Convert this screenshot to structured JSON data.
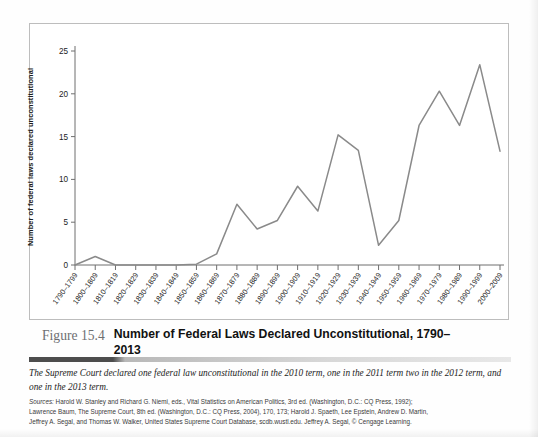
{
  "figure": {
    "number": "Figure 15.4",
    "title": "Number of Federal Laws Declared Unconstitutional, 1790–2013",
    "note": "The Supreme Court declared one federal law unconstitutional in the 2010 term, one in the 2011 term two in the 2012 term, and one in the 2013 term.",
    "sources_label": "Sources:",
    "sources_line1": " Harold W. Stanley and Richard G. Niemi, eds., Vital Statistics on American Politics, 3rd ed. (Washington, D.C.: CQ Press, 1992);",
    "sources_line2": "Lawrence Baum, The Supreme Court, 8th ed. (Washington, D.C.: CQ Press, 2004), 170, 173; Harold J. Spaeth, Lee Epstein, Andrew D. Martin,",
    "sources_line3": "Jeffrey A. Segal, and Thomas W. Walker, United States Supreme Court Database, scdb.wustl.edu. Jeffrey A. Segal, © Cengage Learning."
  },
  "chart_data": {
    "type": "line",
    "title": "Number of Federal Laws Declared Unconstitutional, 1790–2013",
    "xlabel": "",
    "ylabel": "Number of federal laws declared unconstitutional",
    "ylim": [
      0,
      25
    ],
    "yticks": [
      0,
      5,
      10,
      15,
      20,
      25
    ],
    "grid": false,
    "legend": "none",
    "line_color": "#8a8a8a",
    "categories": [
      "1790–1799",
      "1800–1809",
      "1810–1819",
      "1820–1829",
      "1830–1839",
      "1840–1849",
      "1850–1859",
      "1860–1869",
      "1870–1879",
      "1880–1889",
      "1890–1899",
      "1900–1909",
      "1910–1919",
      "1920–1929",
      "1930–1939",
      "1940–1949",
      "1950–1959",
      "1960–1969",
      "1970–1979",
      "1980–1989",
      "1990–1999",
      "2000–2009"
    ],
    "values": [
      0,
      1,
      0,
      0,
      0,
      0,
      0.1,
      1.3,
      7.1,
      4.2,
      5.2,
      9.2,
      6.3,
      15.2,
      13.4,
      2.3,
      5.2,
      16.3,
      20.3,
      16.3,
      23.4,
      13.3
    ]
  }
}
